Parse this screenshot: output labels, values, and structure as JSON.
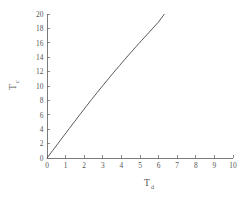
{
  "chart_data": {
    "type": "line",
    "title": "",
    "subtitle": "",
    "xlabel": "T",
    "xlabel_sub": "d",
    "ylabel": "T",
    "ylabel_sub": "c",
    "xlim": [
      0,
      10
    ],
    "ylim": [
      0,
      20
    ],
    "grid": false,
    "legend": false,
    "legend_position": "none",
    "xticks": [
      0,
      1,
      2,
      3,
      4,
      5,
      6,
      7,
      8,
      9,
      10
    ],
    "xticklabels": [
      "0",
      "1",
      "2",
      "3",
      "4",
      "5",
      "6",
      "7",
      "8",
      "9",
      "10"
    ],
    "yticks": [
      0,
      2,
      4,
      6,
      8,
      10,
      12,
      14,
      16,
      18,
      20
    ],
    "yticklabels": [
      "0",
      "2",
      "4",
      "6",
      "8",
      "10",
      "12",
      "14",
      "16",
      "18",
      "20"
    ],
    "series": [
      {
        "name": "curve",
        "color": "#5a5a5a",
        "x": [
          0.0,
          0.3,
          0.6,
          0.9,
          1.2,
          1.5,
          1.8,
          2.1,
          2.4,
          2.7,
          3.0,
          3.3,
          3.6,
          3.9,
          4.2,
          4.5,
          4.8,
          5.1,
          5.4,
          5.7,
          6.0,
          6.3
        ],
        "y": [
          0.0,
          1.02,
          2.05,
          3.08,
          4.1,
          5.12,
          6.14,
          7.14,
          8.13,
          9.1,
          10.06,
          11.0,
          11.93,
          12.84,
          13.74,
          14.63,
          15.5,
          16.36,
          17.21,
          18.05,
          18.9,
          19.95
        ]
      }
    ]
  },
  "figure": {
    "background_color": "#ffffff",
    "axis_color": "#6b6b6b",
    "text_color": "#555555"
  }
}
